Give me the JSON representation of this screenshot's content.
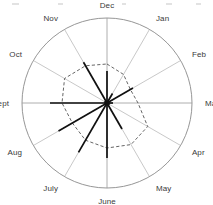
{
  "chart_data": {
    "type": "line",
    "title": "",
    "subtitle": "",
    "xlabel": "",
    "ylabel": "",
    "layout": {
      "polar": true,
      "grid": true,
      "legend_position": "none",
      "spoke_count": 12,
      "angle_step_degrees": 30,
      "start_angle_label": "Dec",
      "start_angle_position": "top",
      "direction": "clockwise",
      "outer_radius": 85,
      "center_x": 107,
      "center_y": 103,
      "rlim": [
        0,
        85
      ]
    },
    "categories": [
      "Dec",
      "Jan",
      "Feb",
      "Mar",
      "Apr",
      "May",
      "June",
      "July",
      "Aug",
      "Sept",
      "Oct",
      "Nov"
    ],
    "series": [
      {
        "name": "solid-rays",
        "style": "solid",
        "render": "rays",
        "color": "#111111",
        "values": [
          32,
          11,
          30,
          6,
          3,
          30,
          55,
          57,
          56,
          57,
          3,
          47
        ]
      },
      {
        "name": "dashed-outline",
        "style": "dashed",
        "render": "closed-polygon",
        "color": "#4a4a4a",
        "values": [
          39,
          33,
          27,
          31,
          47,
          48,
          45,
          43,
          40,
          45,
          49,
          43
        ]
      }
    ]
  },
  "labels": {
    "dec": "Dec",
    "jan": "Jan",
    "feb": "Feb",
    "mar": "Mar",
    "apr": "Apr",
    "may": "May",
    "june": "June",
    "july": "July",
    "aug": "Aug",
    "sept": "Sept",
    "oct": "Oct",
    "nov": "Nov"
  },
  "colors": {
    "outline": "#8a8a8a",
    "spoke": "#b0b0b0",
    "solid_series": "#111111",
    "dashed_series": "#4a4a4a",
    "background": "#ffffff",
    "label_text": "#3a3a3a"
  }
}
